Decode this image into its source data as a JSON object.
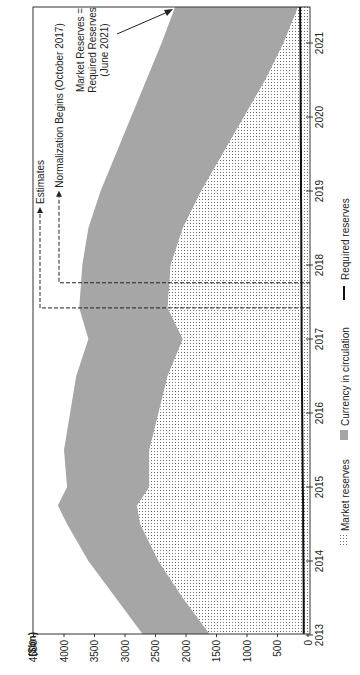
{
  "chart_data": {
    "type": "area",
    "orientation": "rotated-90-ccw",
    "title": "",
    "unit_label": "($bn)",
    "xlabel": "",
    "ylabel": "$bn",
    "x_ticks": [
      "2013",
      "2014",
      "2015",
      "2016",
      "2017",
      "2018",
      "2019",
      "2020",
      "2021"
    ],
    "y_ticks": [
      "0",
      "500",
      "1000",
      "1500",
      "2000",
      "2500",
      "3000",
      "3500",
      "4000",
      "4500"
    ],
    "xlim": [
      2013,
      2021.55
    ],
    "ylim": [
      0,
      4500
    ],
    "x": [
      2013.0,
      2013.5,
      2014.0,
      2014.5,
      2014.75,
      2015.0,
      2015.5,
      2016.0,
      2016.5,
      2017.0,
      2017.42,
      2018.0,
      2018.5,
      2019.0,
      2019.5,
      2020.0,
      2020.5,
      2021.0,
      2021.55
    ],
    "series": [
      {
        "name": "Market reserves",
        "style": "dotted",
        "values": [
          1600,
          2050,
          2450,
          2750,
          2800,
          2600,
          2600,
          2450,
          2300,
          2050,
          2300,
          2250,
          2050,
          1750,
          1400,
          1050,
          700,
          400,
          130
        ]
      },
      {
        "name": "Currency in circulation",
        "style": "gray-fill",
        "stacked_top": [
          2700,
          3150,
          3600,
          3950,
          4100,
          3950,
          4000,
          3900,
          3800,
          3600,
          3750,
          3700,
          3600,
          3400,
          3150,
          2900,
          2650,
          2400,
          2150
        ]
      },
      {
        "name": "Required reserves",
        "style": "line",
        "values": [
          70,
          70,
          75,
          80,
          80,
          85,
          90,
          95,
          100,
          105,
          105,
          110,
          110,
          115,
          115,
          120,
          120,
          125,
          130
        ]
      }
    ],
    "annotations": [
      {
        "text": "Estimates",
        "x": 2017.42,
        "type": "dashed-vline-arrow"
      },
      {
        "text": "Normalization Begins (October 2017)",
        "x": 2017.76,
        "type": "dashed-vline-arrow"
      },
      {
        "text_lines": [
          "Market Reserves =",
          "Required Reserves",
          "(June 2021)"
        ],
        "x": 2021.45,
        "type": "arrow"
      }
    ],
    "legend": [
      {
        "label": "Market reserves",
        "swatch": "dotted"
      },
      {
        "label": "Currency in circulation",
        "swatch": "gray"
      },
      {
        "label": "Required reserves",
        "swatch": "line"
      }
    ],
    "legend_position": "bottom",
    "grid": false
  },
  "colors": {
    "currency_fill": "#a6a6a6",
    "market_dot": "#555555",
    "required_line": "#111111",
    "axis": "#333333"
  }
}
